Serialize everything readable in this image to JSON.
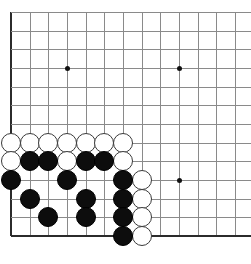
{
  "board": {
    "title": "Go board corner position",
    "game": "go",
    "board_size": 19,
    "visible_columns": 13,
    "visible_rows": 13,
    "origin_x": 11,
    "origin_y": 12,
    "cell": 18.67,
    "grid_color": "#8a8a8a",
    "edge_color": "#2b2b2b",
    "background_color": "#ffffff",
    "black_color": "#0d0d0d",
    "white_color": "#ffffff",
    "stone_diameter": 20,
    "edges": {
      "left": true,
      "bottom": true,
      "top": false,
      "right": false
    },
    "star_points": [
      {
        "col": 3,
        "row": 3,
        "label": "upper-left-star"
      },
      {
        "col": 9,
        "row": 3,
        "label": "upper-right-star"
      },
      {
        "col": 9,
        "row": 9,
        "label": "lower-right-star"
      }
    ],
    "stones": [
      {
        "color": "white",
        "col": 0,
        "row": 7
      },
      {
        "color": "white",
        "col": 1,
        "row": 7
      },
      {
        "color": "white",
        "col": 2,
        "row": 7
      },
      {
        "color": "white",
        "col": 3,
        "row": 7
      },
      {
        "color": "white",
        "col": 4,
        "row": 7
      },
      {
        "color": "white",
        "col": 5,
        "row": 7
      },
      {
        "color": "white",
        "col": 6,
        "row": 7
      },
      {
        "color": "white",
        "col": 0,
        "row": 8
      },
      {
        "color": "black",
        "col": 1,
        "row": 8
      },
      {
        "color": "black",
        "col": 2,
        "row": 8
      },
      {
        "color": "white",
        "col": 3,
        "row": 8
      },
      {
        "color": "black",
        "col": 4,
        "row": 8
      },
      {
        "color": "black",
        "col": 5,
        "row": 8
      },
      {
        "color": "white",
        "col": 6,
        "row": 8
      },
      {
        "color": "black",
        "col": 0,
        "row": 9
      },
      {
        "color": "black",
        "col": 3,
        "row": 9
      },
      {
        "color": "black",
        "col": 6,
        "row": 9
      },
      {
        "color": "white",
        "col": 7,
        "row": 9
      },
      {
        "color": "black",
        "col": 1,
        "row": 10
      },
      {
        "color": "black",
        "col": 4,
        "row": 10
      },
      {
        "color": "black",
        "col": 6,
        "row": 10
      },
      {
        "color": "white",
        "col": 7,
        "row": 10
      },
      {
        "color": "black",
        "col": 2,
        "row": 11
      },
      {
        "color": "black",
        "col": 4,
        "row": 11
      },
      {
        "color": "black",
        "col": 6,
        "row": 11
      },
      {
        "color": "white",
        "col": 7,
        "row": 11
      },
      {
        "color": "black",
        "col": 6,
        "row": 12
      },
      {
        "color": "white",
        "col": 7,
        "row": 12
      }
    ],
    "counts": {
      "black_stones": 16,
      "white_stones": 12,
      "total_stones": 28
    }
  }
}
